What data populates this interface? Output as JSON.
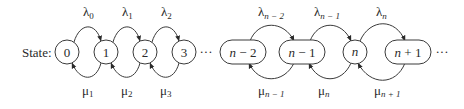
{
  "diagram": {
    "type": "birth-death-process",
    "caption": "State:",
    "ellipsis": "···",
    "nodes": [
      {
        "id": "0",
        "label": "0",
        "shape": "circle",
        "cx": 67
      },
      {
        "id": "1",
        "label": "1",
        "shape": "circle",
        "cx": 106
      },
      {
        "id": "2",
        "label": "2",
        "shape": "circle",
        "cx": 145
      },
      {
        "id": "3",
        "label": "3",
        "shape": "circle",
        "cx": 184
      },
      {
        "id": "n-2",
        "label_var": "n",
        "label_rest": " − 2",
        "shape": "pill",
        "cx": 243
      },
      {
        "id": "n-1",
        "label_var": "n",
        "label_rest": " − 1",
        "shape": "pill",
        "cx": 302
      },
      {
        "id": "n",
        "label_var": "n",
        "label_rest": "",
        "shape": "circle",
        "cx": 355
      },
      {
        "id": "n+1",
        "label_var": "n",
        "label_rest": " + 1",
        "shape": "pill",
        "cx": 408
      }
    ],
    "birth_rates": [
      {
        "symbol": "λ",
        "sub": "0",
        "from": "0",
        "to": "1"
      },
      {
        "symbol": "λ",
        "sub": "1",
        "from": "1",
        "to": "2"
      },
      {
        "symbol": "λ",
        "sub": "2",
        "from": "2",
        "to": "3"
      },
      {
        "symbol": "λ",
        "sub": "n − 2",
        "from": "n-2",
        "to": "n-1"
      },
      {
        "symbol": "λ",
        "sub": "n − 1",
        "from": "n-1",
        "to": "n"
      },
      {
        "symbol": "λ",
        "sub": "n",
        "from": "n",
        "to": "n+1"
      }
    ],
    "death_rates": [
      {
        "symbol": "μ",
        "sub": "1",
        "from": "1",
        "to": "0"
      },
      {
        "symbol": "μ",
        "sub": "2",
        "from": "2",
        "to": "1"
      },
      {
        "symbol": "μ",
        "sub": "3",
        "from": "3",
        "to": "2"
      },
      {
        "symbol": "μ",
        "sub": "n − 1",
        "from": "n-1",
        "to": "n-2"
      },
      {
        "symbol": "μ",
        "sub": "n",
        "from": "n",
        "to": "n-1"
      },
      {
        "symbol": "μ",
        "sub": "n + 1",
        "from": "n+1",
        "to": "n"
      }
    ],
    "colors": {
      "stroke": "#3a3a3a",
      "text": "#2a2a2a",
      "background": "#ffffff"
    }
  }
}
